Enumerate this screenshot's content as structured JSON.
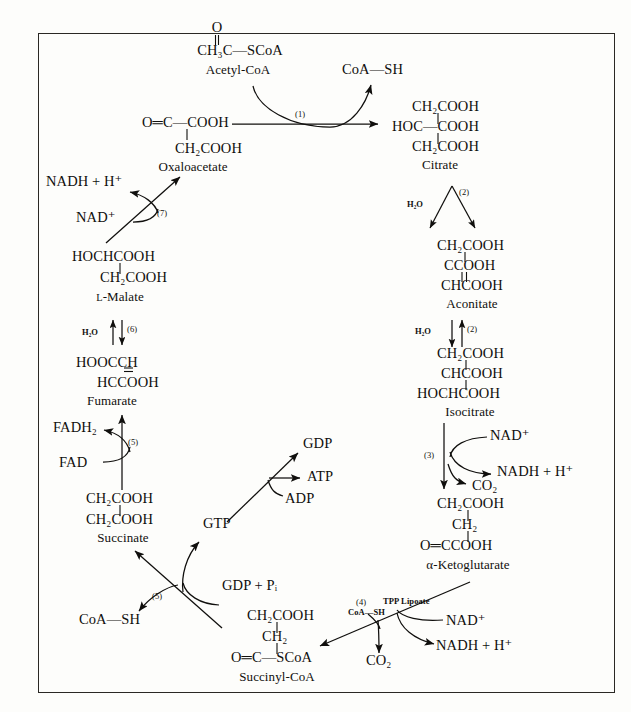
{
  "diagram": {
    "frame": {
      "border_color": "#2a2824"
    },
    "background": "#fdfdfb",
    "ink": "#100f0d"
  },
  "metabolites": {
    "acetyl_coa": {
      "formula_top": "O",
      "formula_main": "CH₃C—SCoA",
      "name": "Acetyl-CoA"
    },
    "oxaloacetate": {
      "line1": "O═C—COOH",
      "line2": "CH₂COOH",
      "name": "Oxaloacetate"
    },
    "citrate": {
      "line1": "CH₂COOH",
      "line2": "HOC—COOH",
      "line3": "CH₂COOH",
      "name": "Citrate"
    },
    "aconitate": {
      "line1": "CH₂COOH",
      "line2": "CCOOH",
      "line3": "CHCOOH",
      "name": "Aconitate"
    },
    "isocitrate": {
      "line1": "CH₂COOH",
      "line2": "CHCOOH",
      "line3": "HOCHCOOH",
      "name": "Isocitrate"
    },
    "alpha_ketoglutarate": {
      "line1": "CH₂COOH",
      "line2": "CH₂",
      "line3": "O═CCOOH",
      "name": "α-Ketoglutarate"
    },
    "succinyl_coa": {
      "line1": "CH₂COOH",
      "line2": "CH₂",
      "line3": "O═C—SCoA",
      "name": "Succinyl-CoA"
    },
    "succinate": {
      "line1": "CH₂COOH",
      "line2": "CH₂COOH",
      "name": "Succinate"
    },
    "fumarate": {
      "line1": "HOOCCH",
      "line2": "HCCOOH",
      "name": "Fumarate"
    },
    "l_malate": {
      "line1": "HOCHCOOH",
      "line2": "CH₂COOH",
      "name_prefix": "L",
      "name": "-Malate"
    }
  },
  "cofactors": {
    "coa_sh_citrate": "CoA—SH",
    "coa_sh_succinyl": "CoA—SH",
    "nad_plus_step3": "NAD⁺",
    "nadh_h_step3": "NADH + H⁺",
    "co2_step3": "CO₂",
    "nad_plus_step4": "NAD⁺",
    "nadh_h_step4": "NADH + H⁺",
    "co2_step4": "CO₂",
    "tpp_lipoate": "TPP Lipoate",
    "coa_sh_step4": "CoA—SH",
    "gdp_pi": "GDP + Pᵢ",
    "gtp": "GTP",
    "gdp": "GDP",
    "atp": "ATP",
    "adp": "ADP",
    "fad": "FAD",
    "fadh2": "FADH₂",
    "h2o_step7": "H₂O",
    "h2o_step2a": "H₂O",
    "h2o_step2b": "H₂O",
    "nad_plus_step8": "NAD⁺",
    "nadh_h_step8": "NADH + H⁺"
  },
  "steps": [
    {
      "id": "1",
      "label": "(1)",
      "enzyme_role": "citrate synthase"
    },
    {
      "id": "2a",
      "label": "(2)",
      "enzyme_role": "aconitase dehydration"
    },
    {
      "id": "2b",
      "label": "(2)",
      "enzyme_role": "aconitase hydration"
    },
    {
      "id": "3",
      "label": "(3)",
      "enzyme_role": "isocitrate dehydrogenase"
    },
    {
      "id": "4",
      "label": "(4)",
      "enzyme_role": "alpha-ketoglutarate dehydrogenase"
    },
    {
      "id": "5",
      "label": "(5)",
      "enzyme_role": "succinyl-CoA synthetase"
    },
    {
      "id": "6",
      "label": "(6)",
      "enzyme_role": "succinate dehydrogenase"
    },
    {
      "id": "7",
      "label": "(7)",
      "enzyme_role": "fumarase"
    },
    {
      "id": "8",
      "label": "(8)",
      "enzyme_role": "malate dehydrogenase"
    }
  ]
}
